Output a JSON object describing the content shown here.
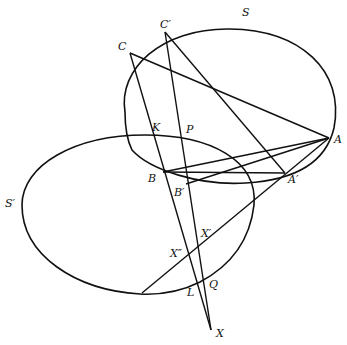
{
  "diagram": {
    "curves": [
      {
        "name": "S",
        "label": "S"
      },
      {
        "name": "S-prime",
        "label": "S′"
      }
    ],
    "points": {
      "C": "C",
      "C_prime": "C′",
      "S": "S",
      "K": "K",
      "P": "P",
      "A": "A",
      "A_prime": "A′",
      "B": "B",
      "B_prime": "B′",
      "S_prime": "S′",
      "X_prime": "X′",
      "X_double_prime": "X″",
      "L": "L",
      "Q": "Q",
      "X": "X"
    }
  }
}
